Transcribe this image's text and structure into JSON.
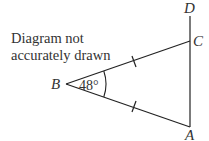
{
  "note": {
    "line1": "Diagram not",
    "line2": "accurately drawn"
  },
  "points": {
    "A": "A",
    "B": "B",
    "C": "C",
    "D": "D"
  },
  "angle": {
    "vertex": "B",
    "value": "48°"
  },
  "marks": {
    "BC_equals_BA": true
  },
  "colors": {
    "line": "#222222",
    "text": "#333333"
  }
}
